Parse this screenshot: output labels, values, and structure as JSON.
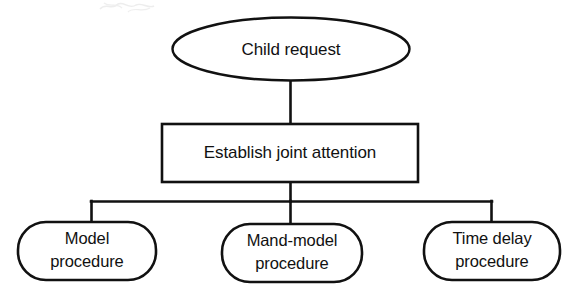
{
  "diagram": {
    "type": "flowchart",
    "orientation": "top-down",
    "colors": {
      "stroke": "#111111",
      "fill": "#ffffff",
      "background": "#ffffff"
    },
    "nodes": {
      "root": {
        "label": "Child request",
        "shape": "ellipse",
        "level": 0
      },
      "step": {
        "label": "Establish joint attention",
        "shape": "rectangle",
        "level": 1
      },
      "branches": [
        {
          "id": "model",
          "line1": "Model",
          "line2": "procedure",
          "shape": "rounded-rectangle",
          "level": 2
        },
        {
          "id": "mand-model",
          "line1": "Mand-model",
          "line2": "procedure",
          "shape": "rounded-rectangle",
          "level": 2
        },
        {
          "id": "time-delay",
          "line1": "Time delay",
          "line2": "procedure",
          "shape": "rounded-rectangle",
          "level": 2
        }
      ]
    }
  }
}
